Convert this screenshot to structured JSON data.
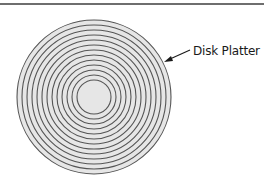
{
  "diagram": {
    "title": "",
    "callout": {
      "label": "Disk Platter"
    },
    "platter": {
      "center": [
        94,
        97
      ],
      "outer_radius": 77,
      "hub_radius": 17,
      "ring_count": 13,
      "fill_color": "#e6e6e6",
      "ring_color": "#555555"
    },
    "colors": {
      "background": "#ffffff",
      "top_rule": "#6e6e6e",
      "arrow": "#1a1a1a"
    }
  }
}
